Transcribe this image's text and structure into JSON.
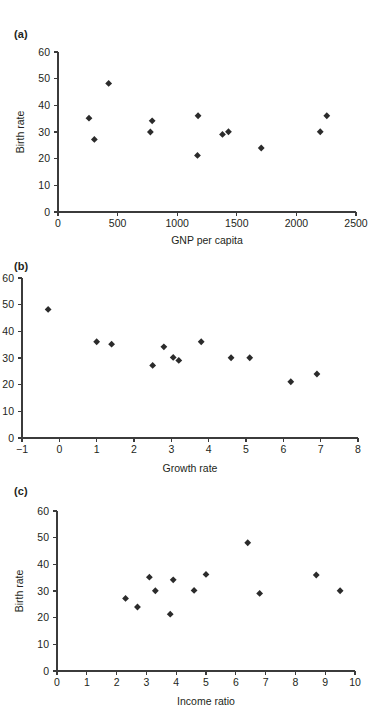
{
  "figure": {
    "background": "#ffffff",
    "marker_color": "#2b2b2b",
    "axis_color": "#3b3b3b",
    "text_color": "#231f20"
  },
  "panels": [
    {
      "label": "(a)",
      "name": "panel-a"
    },
    {
      "label": "(b)",
      "name": "panel-b"
    },
    {
      "label": "(c)",
      "name": "panel-c"
    }
  ],
  "chart_data": [
    {
      "type": "scatter",
      "panel": "(a)",
      "title": "",
      "xlabel": "GNP per capita",
      "ylabel": "Birth rate",
      "xlim": [
        0,
        2500
      ],
      "ylim": [
        0,
        60
      ],
      "xticks": [
        0,
        500,
        1000,
        1500,
        2000,
        2500
      ],
      "yticks": [
        0,
        10,
        20,
        30,
        40,
        50,
        60
      ],
      "xticklabels": [
        "0",
        "500",
        "1000",
        "1500",
        "2000",
        "2500"
      ],
      "yticklabels": [
        "0",
        "10",
        "20",
        "30",
        "40",
        "50",
        "60"
      ],
      "grid": false,
      "legend": false,
      "marker": "diamond",
      "points": [
        {
          "x": 260,
          "y": 35.2
        },
        {
          "x": 305,
          "y": 27.2
        },
        {
          "x": 425,
          "y": 48.2
        },
        {
          "x": 775,
          "y": 30.0
        },
        {
          "x": 790,
          "y": 34.2
        },
        {
          "x": 1170,
          "y": 21.2
        },
        {
          "x": 1175,
          "y": 36.1
        },
        {
          "x": 1380,
          "y": 29.1
        },
        {
          "x": 1430,
          "y": 30.1
        },
        {
          "x": 1705,
          "y": 24.0
        },
        {
          "x": 2200,
          "y": 30.1
        },
        {
          "x": 2255,
          "y": 36.1
        }
      ]
    },
    {
      "type": "scatter",
      "panel": "(b)",
      "title": "",
      "xlabel": "Growth rate",
      "ylabel": "Birth rate",
      "xlim": [
        -1,
        8
      ],
      "ylim": [
        0,
        60
      ],
      "xticks": [
        -1,
        0,
        1,
        2,
        3,
        4,
        5,
        6,
        7,
        8
      ],
      "yticks": [
        0,
        10,
        20,
        30,
        40,
        50,
        60
      ],
      "xticklabels": [
        "−1",
        "0",
        "1",
        "2",
        "3",
        "4",
        "5",
        "6",
        "7",
        "8"
      ],
      "yticklabels": [
        "0",
        "10",
        "20",
        "30",
        "40",
        "50",
        "60"
      ],
      "grid": false,
      "legend": false,
      "marker": "diamond",
      "points": [
        {
          "x": -0.3,
          "y": 48.2
        },
        {
          "x": 1.0,
          "y": 36.1
        },
        {
          "x": 1.4,
          "y": 35.2
        },
        {
          "x": 2.5,
          "y": 27.2
        },
        {
          "x": 2.8,
          "y": 34.2
        },
        {
          "x": 3.05,
          "y": 30.2
        },
        {
          "x": 3.2,
          "y": 29.1
        },
        {
          "x": 3.8,
          "y": 36.1
        },
        {
          "x": 4.6,
          "y": 30.1
        },
        {
          "x": 5.1,
          "y": 30.1
        },
        {
          "x": 6.2,
          "y": 21.1
        },
        {
          "x": 6.9,
          "y": 24.0
        }
      ]
    },
    {
      "type": "scatter",
      "panel": "(c)",
      "title": "",
      "xlabel": "Income ratio",
      "ylabel": "Birth rate",
      "xlim": [
        0,
        10
      ],
      "ylim": [
        0,
        60
      ],
      "xticks": [
        0,
        1,
        2,
        3,
        4,
        5,
        6,
        7,
        8,
        9,
        10
      ],
      "yticks": [
        0,
        10,
        20,
        30,
        40,
        50,
        60
      ],
      "xticklabels": [
        "0",
        "1",
        "2",
        "3",
        "4",
        "5",
        "6",
        "7",
        "8",
        "9",
        "10"
      ],
      "yticklabels": [
        "0",
        "10",
        "20",
        "30",
        "40",
        "50",
        "60"
      ],
      "grid": false,
      "legend": false,
      "marker": "diamond",
      "points": [
        {
          "x": 2.3,
          "y": 27.2
        },
        {
          "x": 2.7,
          "y": 24.0
        },
        {
          "x": 3.1,
          "y": 35.2
        },
        {
          "x": 3.3,
          "y": 30.1
        },
        {
          "x": 3.8,
          "y": 21.3
        },
        {
          "x": 3.9,
          "y": 34.2
        },
        {
          "x": 4.6,
          "y": 30.2
        },
        {
          "x": 5.0,
          "y": 36.2
        },
        {
          "x": 6.4,
          "y": 48.1
        },
        {
          "x": 6.8,
          "y": 29.1
        },
        {
          "x": 8.7,
          "y": 36.0
        },
        {
          "x": 9.5,
          "y": 30.1
        }
      ]
    }
  ]
}
